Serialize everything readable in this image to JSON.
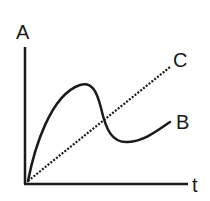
{
  "diagram": {
    "type": "concept-graph",
    "y_axis_label": "A",
    "x_axis_label": "t",
    "curves": [
      {
        "id": "B",
        "label": "B",
        "style": "solid",
        "color": "#1a1a1a",
        "description": "rises steeply from origin to a peak, falls sharply to a trough, then rises gently"
      },
      {
        "id": "C",
        "label": "C",
        "style": "dotted",
        "color": "#1a1a1a",
        "description": "straight line increasing linearly from origin"
      }
    ],
    "colors": {
      "ink": "#1a1a1a",
      "background": "#ffffff"
    }
  }
}
